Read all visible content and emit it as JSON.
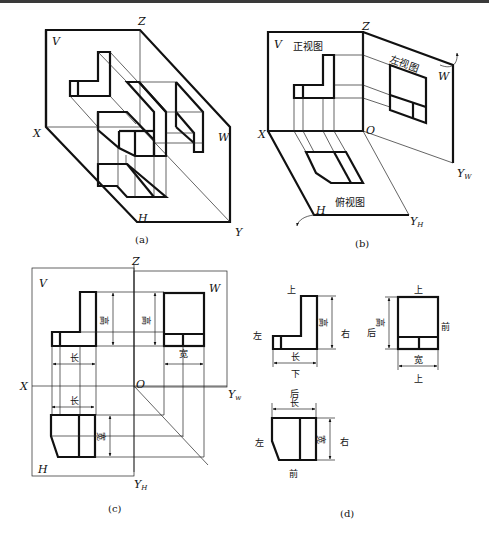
{
  "figure": {
    "panels": [
      {
        "id": "a",
        "caption": "(a)",
        "axis_labels": {
          "z": "Z",
          "x": "X",
          "y": "Y",
          "v": "V",
          "w": "W",
          "h": "H"
        }
      },
      {
        "id": "b",
        "caption": "(b)",
        "axis_labels": {
          "z": "Z",
          "x": "X",
          "o": "O",
          "v": "V",
          "w": "W",
          "h": "H",
          "yw": "Y",
          "yw_sub": "W",
          "yh": "Y",
          "yh_sub": "H"
        },
        "view_labels": {
          "front": "正视图",
          "left": "左视图",
          "top": "俯视图"
        }
      },
      {
        "id": "c",
        "caption": "(c)",
        "axis_labels": {
          "z": "Z",
          "x": "X",
          "o": "O",
          "v": "V",
          "w": "W",
          "h": "H",
          "yw": "Y",
          "yw_sub": "w",
          "yh": "Y",
          "yh_sub": "H"
        },
        "dimension_labels": {
          "front_height": "高",
          "side_height": "高",
          "front_length": "长",
          "top_length": "长",
          "side_width": "宽",
          "top_width": "宽"
        }
      },
      {
        "id": "d",
        "caption": "(d)",
        "front_view": {
          "top": "上",
          "bottom": "下",
          "left": "左",
          "right": "右",
          "height": "高",
          "length": "长"
        },
        "side_view": {
          "top": "上",
          "bottom": "上",
          "left": "后",
          "right": "前",
          "height": "高",
          "width": "宽"
        },
        "top_view": {
          "top": "后",
          "bottom": "前",
          "left": "左",
          "right": "右",
          "length": "长",
          "width": "宽"
        }
      }
    ]
  }
}
